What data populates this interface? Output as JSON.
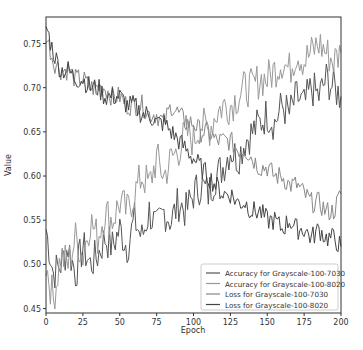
{
  "chart_data": {
    "type": "line",
    "title": "",
    "xlabel": "Epoch",
    "ylabel": "Value",
    "xlim": [
      0,
      200
    ],
    "ylim": [
      0.445,
      0.78
    ],
    "x_ticks": [
      0,
      25,
      50,
      75,
      100,
      125,
      150,
      175,
      200
    ],
    "y_ticks": [
      0.45,
      0.5,
      0.55,
      0.6,
      0.65,
      0.7,
      0.75
    ],
    "y_tick_labels": [
      "0.45",
      "0.50",
      "0.55",
      "0.60",
      "0.65",
      "0.70",
      "0.75"
    ],
    "grid": false,
    "legend_position": "lower right",
    "x": [
      0,
      5,
      10,
      15,
      20,
      25,
      30,
      35,
      40,
      45,
      50,
      55,
      60,
      65,
      70,
      75,
      80,
      85,
      90,
      95,
      100,
      105,
      110,
      115,
      120,
      125,
      130,
      135,
      140,
      145,
      150,
      155,
      160,
      165,
      170,
      175,
      180,
      185,
      190,
      195,
      200
    ],
    "series": [
      {
        "name": "Accuracy for Grayscale-100-7030",
        "color": "#555555",
        "values": [
          0.54,
          0.49,
          0.5,
          0.52,
          0.49,
          0.52,
          0.5,
          0.51,
          0.53,
          0.52,
          0.54,
          0.52,
          0.55,
          0.53,
          0.56,
          0.54,
          0.56,
          0.55,
          0.57,
          0.56,
          0.58,
          0.59,
          0.58,
          0.6,
          0.61,
          0.63,
          0.62,
          0.64,
          0.65,
          0.66,
          0.67,
          0.66,
          0.68,
          0.67,
          0.69,
          0.68,
          0.7,
          0.69,
          0.71,
          0.7,
          0.69
        ]
      },
      {
        "name": "Accuracy for Grayscale-100-8020",
        "color": "#999999",
        "values": [
          0.5,
          0.46,
          0.51,
          0.5,
          0.53,
          0.51,
          0.55,
          0.53,
          0.56,
          0.55,
          0.57,
          0.56,
          0.58,
          0.6,
          0.59,
          0.62,
          0.6,
          0.62,
          0.63,
          0.65,
          0.64,
          0.66,
          0.65,
          0.67,
          0.68,
          0.68,
          0.69,
          0.7,
          0.7,
          0.71,
          0.71,
          0.72,
          0.73,
          0.72,
          0.74,
          0.73,
          0.74,
          0.75,
          0.74,
          0.73,
          0.74
        ]
      },
      {
        "name": "Loss for Grayscale-100-7030",
        "color": "#888888",
        "values": [
          0.76,
          0.73,
          0.72,
          0.72,
          0.71,
          0.71,
          0.7,
          0.7,
          0.7,
          0.69,
          0.69,
          0.68,
          0.68,
          0.68,
          0.67,
          0.67,
          0.66,
          0.68,
          0.67,
          0.66,
          0.66,
          0.65,
          0.65,
          0.64,
          0.64,
          0.64,
          0.63,
          0.63,
          0.62,
          0.61,
          0.61,
          0.6,
          0.6,
          0.59,
          0.59,
          0.58,
          0.57,
          0.57,
          0.56,
          0.56,
          0.58
        ]
      },
      {
        "name": "Loss for Grayscale-100-8020",
        "color": "#444444",
        "values": [
          0.77,
          0.74,
          0.72,
          0.72,
          0.71,
          0.71,
          0.7,
          0.7,
          0.69,
          0.69,
          0.69,
          0.68,
          0.68,
          0.67,
          0.67,
          0.66,
          0.66,
          0.65,
          0.64,
          0.63,
          0.62,
          0.61,
          0.6,
          0.59,
          0.58,
          0.58,
          0.57,
          0.57,
          0.56,
          0.56,
          0.55,
          0.55,
          0.54,
          0.55,
          0.54,
          0.54,
          0.53,
          0.54,
          0.53,
          0.53,
          0.52
        ]
      }
    ]
  }
}
